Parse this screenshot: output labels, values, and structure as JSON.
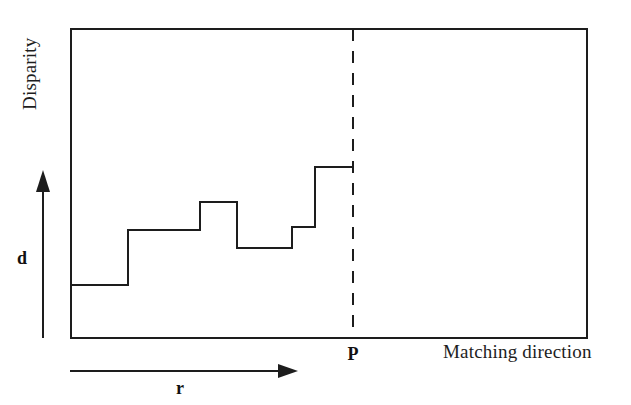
{
  "figure": {
    "background_color": "#ffffff",
    "line_color": "#1d1d1d",
    "width": 631,
    "height": 405
  },
  "labels": {
    "y_axis": "Disparity",
    "x_axis": "Matching direction",
    "disparity_arrow": "d",
    "range_arrow": "r",
    "marker_point": "P"
  },
  "chart_data": {
    "type": "line",
    "title": "",
    "subtitle": "",
    "xlabel": "Matching direction",
    "ylabel": "Disparity",
    "grid": false,
    "legend": null,
    "xlim": [
      0,
      100
    ],
    "ylim": [
      0,
      100
    ],
    "axis_ticks": {
      "x": [],
      "y": []
    },
    "series": [
      {
        "name": "Disparity step profile",
        "style": "step-post",
        "x_start": [
          0.0,
          11.0,
          25.0,
          32.2,
          42.8,
          50.5
        ],
        "x_end": [
          11.0,
          25.0,
          32.2,
          42.8,
          50.5,
          54.7
        ],
        "values": [
          17.2,
          35.0,
          44.0,
          29.1,
          35.9,
          55.3
        ]
      }
    ],
    "annotations": [
      {
        "name": "marker-dashed-line",
        "kind": "vertical-dashed-line",
        "x": 54.7,
        "label": "P"
      },
      {
        "name": "range-arrow",
        "kind": "horizontal-arrow",
        "x_from": 0.0,
        "x_to": 43.5,
        "label": "r"
      },
      {
        "name": "disparity-arrow",
        "kind": "vertical-arrow",
        "label": "d"
      }
    ]
  },
  "geometry": {
    "plot_box": {
      "x1": 71,
      "y1": 29,
      "x2": 587,
      "y2": 338
    },
    "step_points": "71,285 128,285 128,230 200,230 200,202 237,202 237,248 292,248 292,227 315,227 315,167 353,167",
    "dashed_line": {
      "x": 353,
      "y1": 29,
      "y2": 338
    },
    "range_arrow": {
      "x1": 70,
      "x2": 296,
      "y": 371
    },
    "disparity_arrow": {
      "x": 43,
      "y_bottom": 338,
      "y_top": 172
    },
    "label_positions": {
      "y_axis": {
        "x": 36,
        "y": 110,
        "rotate": -90
      },
      "x_axis": {
        "x": 443,
        "y": 358
      },
      "disparity_arrow": {
        "x": 18,
        "y": 263
      },
      "range_arrow": {
        "x": 175,
        "y": 392
      },
      "marker_point": {
        "x": 347,
        "y": 360
      }
    }
  }
}
